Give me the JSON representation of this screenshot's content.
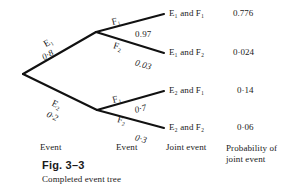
{
  "figure": {
    "number": "Fig. 3–3",
    "caption": "Completed event tree"
  },
  "columns": {
    "event1": "Event",
    "event2": "Event",
    "joint": "Joint event",
    "probability": "Probability of joint event"
  },
  "tree": {
    "root_label": "",
    "branches_level1": [
      {
        "name": "E-one",
        "event": "E₁",
        "probability": "0·8"
      },
      {
        "name": "E-two",
        "event": "E₂",
        "probability": "0·2"
      }
    ],
    "branches_level2": [
      {
        "name": "E1-F1",
        "event": "F₁",
        "probability": "0.97"
      },
      {
        "name": "E1-F2",
        "event": "F₂",
        "probability": "0.03"
      },
      {
        "name": "E2-F1",
        "event": "F₁",
        "probability": "0·7"
      },
      {
        "name": "E2-F2",
        "event": "F₂",
        "probability": "0·3"
      }
    ],
    "outcomes": [
      {
        "joint_event": "E₁ and F₁",
        "joint_probability": "0.776"
      },
      {
        "joint_event": "E₁ and F₂",
        "joint_probability": "0·024"
      },
      {
        "joint_event": "E₂ and F₁",
        "joint_probability": "0·14"
      },
      {
        "joint_event": "E₂ and F₂",
        "joint_probability": "0·06"
      }
    ]
  },
  "style": {
    "line_color": "#111111",
    "text_color": "#1a1a1a",
    "background": "#ffffff"
  }
}
